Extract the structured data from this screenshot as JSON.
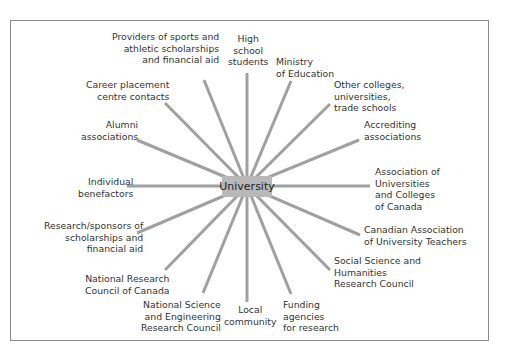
{
  "diagram": {
    "type": "radial-stakeholder-diagram",
    "center": {
      "label": "University"
    },
    "line_color": "#a0a0a0",
    "center_fill": "#b8b8b8",
    "nodes": [
      {
        "id": "high-school-students",
        "label": "High\nschool\nstudents"
      },
      {
        "id": "ministry-of-education",
        "label": "Ministry\nof Education"
      },
      {
        "id": "other-colleges",
        "label": "Other colleges,\nuniversities,\ntrade schools"
      },
      {
        "id": "accrediting-associations",
        "label": "Accrediting\nassociations"
      },
      {
        "id": "aucc",
        "label": "Association of\nUniversities\nand Colleges\nof Canada"
      },
      {
        "id": "caut",
        "label": "Canadian Association\nof University Teachers"
      },
      {
        "id": "sshrc",
        "label": "Social Science and\nHumanities\nResearch Council"
      },
      {
        "id": "funding-agencies",
        "label": "Funding\nagencies\nfor research"
      },
      {
        "id": "local-community",
        "label": "Local\ncommunity"
      },
      {
        "id": "nserc",
        "label": "National Science\nand Engineering\nResearch Council"
      },
      {
        "id": "nrc",
        "label": "National Research\nCouncil of Canada"
      },
      {
        "id": "research-sponsors",
        "label": "Research/sponsors of\nscholarships and\nfinancial aid"
      },
      {
        "id": "individual-benefactors",
        "label": "Individual\nbenefactors"
      },
      {
        "id": "alumni-associations",
        "label": "Alumni\nassociations"
      },
      {
        "id": "career-placement",
        "label": "Career placement\ncentre contacts"
      },
      {
        "id": "sports-providers",
        "label": "Providers of sports and\nathletic scholarships\nand financial aid"
      }
    ]
  }
}
